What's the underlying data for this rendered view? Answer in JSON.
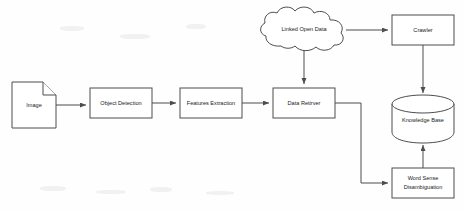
{
  "diagram": {
    "style": {
      "stroke": "#4d4d4d",
      "fill": "#ffffff",
      "text": "#1a1a1a",
      "background": "#fefefe"
    },
    "nodes": [
      {
        "id": "image",
        "label": "Image",
        "shape": "document",
        "x": 12,
        "y": 82,
        "w": 44,
        "h": 46
      },
      {
        "id": "object_detection",
        "label": "Object Detection",
        "shape": "rectangle",
        "x": 90,
        "y": 88,
        "w": 62,
        "h": 30
      },
      {
        "id": "features_extraction",
        "label": "Features Extraction",
        "shape": "rectangle",
        "x": 180,
        "y": 88,
        "w": 62,
        "h": 30
      },
      {
        "id": "data_retirver",
        "label": "Data Retirver",
        "shape": "rectangle",
        "x": 273,
        "y": 88,
        "w": 62,
        "h": 30
      },
      {
        "id": "linked_open_data",
        "label": "Linked Open Data",
        "shape": "cloud",
        "x": 262,
        "y": 12,
        "w": 84,
        "h": 40
      },
      {
        "id": "crawler",
        "label": "Crawler",
        "shape": "rectangle",
        "x": 392,
        "y": 15,
        "w": 62,
        "h": 30
      },
      {
        "id": "knowledge_base",
        "label": "Knowledge Base",
        "shape": "cylinder",
        "x": 392,
        "y": 95,
        "w": 62,
        "h": 46
      },
      {
        "id": "word_sense_disambiguation",
        "label": "Word Sense Disambiguation",
        "label_line_1": "Word Sense",
        "label_line_2": "Disambiguation",
        "shape": "rectangle",
        "x": 392,
        "y": 168,
        "w": 62,
        "h": 30
      }
    ],
    "edges": [
      {
        "id": "e1",
        "from": "image",
        "to": "object_detection",
        "label": ""
      },
      {
        "id": "e2",
        "from": "object_detection",
        "to": "features_extraction",
        "label": ""
      },
      {
        "id": "e3",
        "from": "features_extraction",
        "to": "data_retirver",
        "label": ""
      },
      {
        "id": "e4",
        "from": "linked_open_data",
        "to": "data_retirver",
        "label": ""
      },
      {
        "id": "e5",
        "from": "linked_open_data",
        "to": "crawler",
        "label": ""
      },
      {
        "id": "e6",
        "from": "crawler",
        "to": "knowledge_base",
        "label": ""
      },
      {
        "id": "e7",
        "from": "data_retirver",
        "to": "word_sense_disambiguation",
        "label": ""
      },
      {
        "id": "e8",
        "from": "word_sense_disambiguation",
        "to": "knowledge_base",
        "label": ""
      }
    ]
  }
}
